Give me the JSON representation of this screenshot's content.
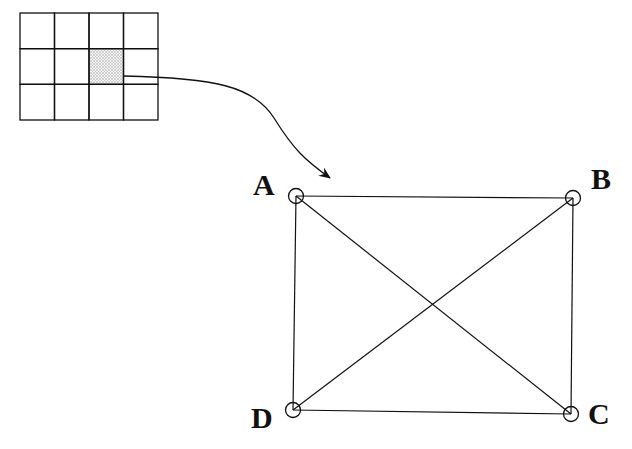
{
  "diagram": {
    "grid": {
      "rows": 3,
      "cols": 4,
      "x": 20,
      "y": 13,
      "width": 138,
      "height": 107,
      "highlighted_cell": {
        "row": 1,
        "col": 2
      }
    },
    "arrow": {
      "from": [
        124,
        76
      ],
      "to": [
        330,
        178
      ],
      "description": "curved arrow from highlighted grid cell to node A"
    },
    "nodes": [
      {
        "id": "A",
        "label": "A",
        "cx": 296,
        "cy": 196,
        "lx": 253,
        "ly": 195
      },
      {
        "id": "B",
        "label": "B",
        "cx": 573,
        "cy": 198,
        "lx": 591,
        "ly": 189
      },
      {
        "id": "C",
        "label": "C",
        "cx": 571,
        "cy": 414,
        "lx": 588,
        "ly": 424
      },
      {
        "id": "D",
        "label": "D",
        "cx": 293,
        "cy": 410,
        "lx": 251,
        "ly": 428
      }
    ],
    "edges": [
      [
        "A",
        "B"
      ],
      [
        "B",
        "C"
      ],
      [
        "C",
        "D"
      ],
      [
        "D",
        "A"
      ],
      [
        "A",
        "C"
      ],
      [
        "B",
        "D"
      ]
    ],
    "colors": {
      "stroke": "#111111",
      "highlight_fill": "#d8d8d8",
      "background": "#ffffff"
    }
  }
}
